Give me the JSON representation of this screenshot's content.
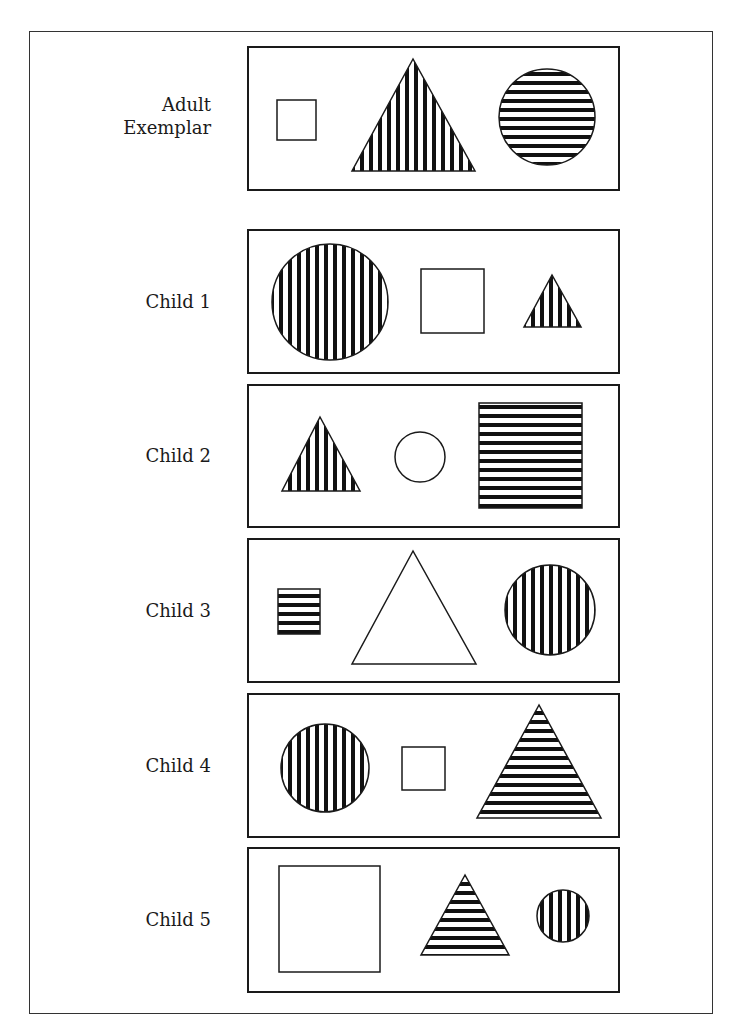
{
  "figure": {
    "rows": [
      {
        "label_lines": [
          "Adult",
          "Exemplar"
        ],
        "panel": {
          "top": 46,
          "height": 145
        },
        "shapes": [
          {
            "type": "square",
            "fill": "none",
            "x": 277,
            "y": 100,
            "w": 39,
            "h": 40
          },
          {
            "type": "triangle",
            "fill": "vertical-stripes",
            "apex": [
              413,
              59
            ],
            "base_left": [
              352,
              171
            ],
            "base_right": [
              475,
              171
            ]
          },
          {
            "type": "circle",
            "fill": "horizontal-stripes",
            "cx": 547,
            "cy": 117,
            "r": 48
          }
        ]
      },
      {
        "label_lines": [
          "Child 1"
        ],
        "panel": {
          "top": 229,
          "height": 145
        },
        "shapes": [
          {
            "type": "circle",
            "fill": "vertical-stripes",
            "cx": 330,
            "cy": 302,
            "r": 58
          },
          {
            "type": "square",
            "fill": "none",
            "x": 421,
            "y": 269,
            "w": 63,
            "h": 64
          },
          {
            "type": "triangle",
            "fill": "vertical-stripes",
            "apex": [
              552,
              275
            ],
            "base_left": [
              524,
              327
            ],
            "base_right": [
              581,
              327
            ]
          }
        ]
      },
      {
        "label_lines": [
          "Child 2"
        ],
        "panel": {
          "top": 384,
          "height": 144
        },
        "shapes": [
          {
            "type": "triangle",
            "fill": "vertical-stripes",
            "apex": [
              320,
              417
            ],
            "base_left": [
              282,
              491
            ],
            "base_right": [
              360,
              491
            ]
          },
          {
            "type": "circle",
            "fill": "none",
            "cx": 420,
            "cy": 457,
            "r": 25
          },
          {
            "type": "square",
            "fill": "horizontal-stripes",
            "x": 479,
            "y": 403,
            "w": 103,
            "h": 105
          }
        ]
      },
      {
        "label_lines": [
          "Child 3"
        ],
        "panel": {
          "top": 538,
          "height": 145
        },
        "shapes": [
          {
            "type": "square",
            "fill": "horizontal-stripes",
            "x": 278,
            "y": 589,
            "w": 42,
            "h": 45
          },
          {
            "type": "triangle",
            "fill": "none",
            "apex": [
              413,
              551
            ],
            "base_left": [
              352,
              664
            ],
            "base_right": [
              476,
              664
            ]
          },
          {
            "type": "circle",
            "fill": "vertical-stripes",
            "cx": 550,
            "cy": 610,
            "r": 45
          }
        ]
      },
      {
        "label_lines": [
          "Child 4"
        ],
        "panel": {
          "top": 693,
          "height": 145
        },
        "shapes": [
          {
            "type": "circle",
            "fill": "vertical-stripes",
            "cx": 325,
            "cy": 768,
            "r": 44
          },
          {
            "type": "square",
            "fill": "none",
            "x": 402,
            "y": 747,
            "w": 43,
            "h": 43
          },
          {
            "type": "triangle",
            "fill": "horizontal-stripes",
            "apex": [
              539,
              705
            ],
            "base_left": [
              477,
              818
            ],
            "base_right": [
              601,
              818
            ]
          }
        ]
      },
      {
        "label_lines": [
          "Child 5"
        ],
        "panel": {
          "top": 847,
          "height": 146
        },
        "shapes": [
          {
            "type": "square",
            "fill": "none",
            "x": 279,
            "y": 866,
            "w": 101,
            "h": 106
          },
          {
            "type": "triangle",
            "fill": "horizontal-stripes",
            "apex": [
              465,
              875
            ],
            "base_left": [
              421,
              955
            ],
            "base_right": [
              509,
              955
            ]
          },
          {
            "type": "circle",
            "fill": "vertical-stripes",
            "cx": 563,
            "cy": 916,
            "r": 26
          }
        ]
      }
    ],
    "style": {
      "stroke_color": "#1a1a1a",
      "stripe_color": "#111111",
      "stripe_period": 9,
      "stripe_width": 4
    }
  }
}
